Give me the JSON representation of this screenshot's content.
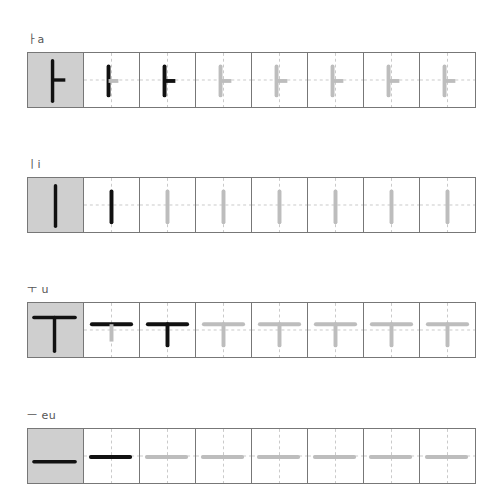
{
  "rows": [
    {
      "label": "ㅏa",
      "glyph": "a",
      "top": 52,
      "label_top": 30
    },
    {
      "label": "ㅣi",
      "glyph": "i",
      "top": 177,
      "label_top": 155
    },
    {
      "label": "ㅜ u",
      "glyph": "u",
      "top": 302,
      "label_top": 280
    },
    {
      "label": "ㅡ eu",
      "glyph": "eu",
      "top": 428,
      "label_top": 406
    }
  ],
  "cells_per_row": 8,
  "colors": {
    "model_bg": "#cfcfcf",
    "stroke_black": "#111111",
    "stroke_gray": "#bdbdbd",
    "guide": "#c8c8c8",
    "border": "#777777"
  },
  "stroke_progression": {
    "a": [
      "model",
      "step1",
      "full",
      "trace",
      "trace",
      "trace",
      "trace",
      "trace"
    ],
    "i": [
      "model",
      "full",
      "trace",
      "trace",
      "trace",
      "trace",
      "trace",
      "trace"
    ],
    "u": [
      "model",
      "step1",
      "full",
      "trace",
      "trace",
      "trace",
      "trace",
      "trace"
    ],
    "eu": [
      "model",
      "full",
      "trace",
      "trace",
      "trace",
      "trace",
      "trace",
      "trace"
    ]
  }
}
